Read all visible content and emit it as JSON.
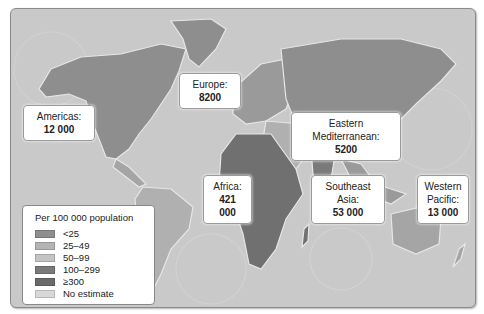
{
  "map": {
    "title": "Estimated cases by WHO region",
    "regions": [
      {
        "name": "Americas:",
        "value": "12 000"
      },
      {
        "name": "Europe:",
        "value": "8200"
      },
      {
        "name": "Eastern Mediterranean:",
        "value": "5200"
      },
      {
        "name": "Africa:",
        "value": "421 000"
      },
      {
        "name": "Southeast Asia:",
        "value": "53 000"
      },
      {
        "name": "Western Pacific:",
        "name_line1": "Western",
        "name_line2": "Pacific:",
        "value": "13 000"
      }
    ]
  },
  "legend": {
    "title": "Per 100 000 population",
    "items": [
      {
        "label": "<25",
        "color": "#8e8e8e"
      },
      {
        "label": "25–49",
        "color": "#b4b4b4"
      },
      {
        "label": "50–99",
        "color": "#c4c4c4"
      },
      {
        "label": "100–299",
        "color": "#7a7a7a"
      },
      {
        "label": "≥300",
        "color": "#6a6a6a"
      },
      {
        "label": "No estimate",
        "color": "#d8d8d8"
      }
    ]
  },
  "colors": {
    "ocean": "#c9c9c9",
    "land_default": "#8e8e8e",
    "africa": "#707070"
  }
}
